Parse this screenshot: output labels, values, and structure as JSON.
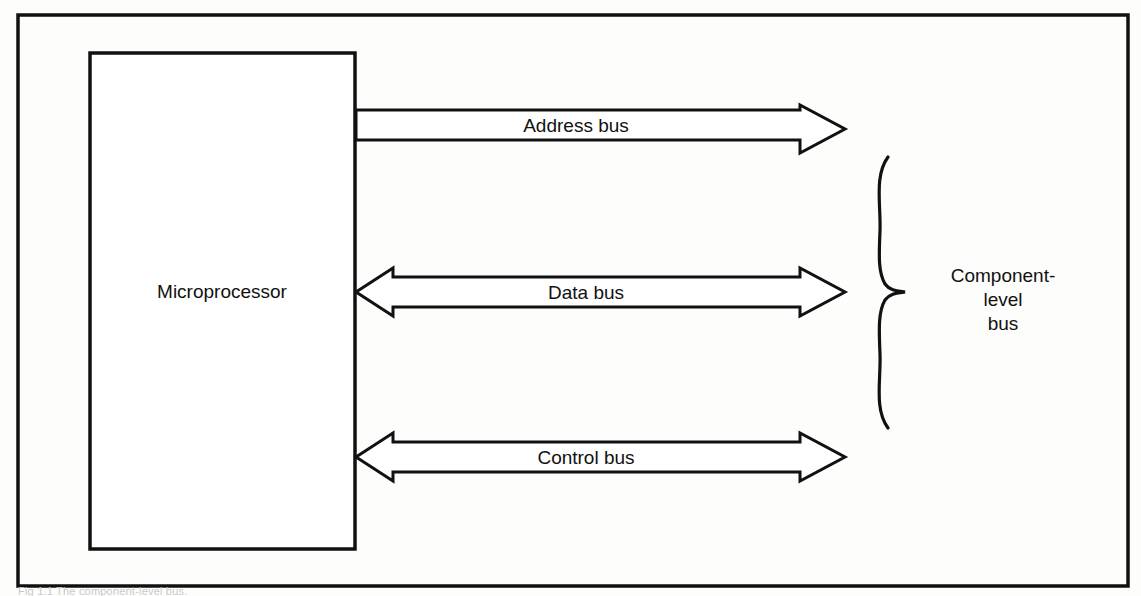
{
  "figure": {
    "title_block_label": "Microprocessor",
    "brace_label_lines": [
      "Component-",
      "level",
      "bus"
    ],
    "buses": [
      {
        "name": "address-bus",
        "label": "Address bus",
        "direction": "right"
      },
      {
        "name": "data-bus",
        "label": "Data bus",
        "direction": "both"
      },
      {
        "name": "control-bus",
        "label": "Control bus",
        "direction": "both"
      }
    ],
    "caption": "Fig 1.1  The component-level bus.",
    "colors": {
      "ink": "#111111",
      "paper": "#fdfdfc",
      "arrow_fill": "#ffffff",
      "caption_ink": "#c9c9c9"
    }
  }
}
